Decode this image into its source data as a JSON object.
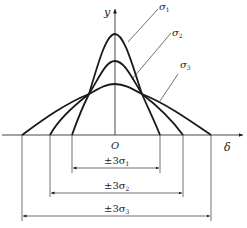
{
  "diagram": {
    "title": "",
    "axes": {
      "y_label": "y",
      "x_label": "δ",
      "origin_label": "O"
    },
    "curves": [
      {
        "name": "σ1",
        "label": "σ",
        "sub": "1",
        "peak_y": 34,
        "base_left": 72,
        "base_right": 160
      },
      {
        "name": "σ2",
        "label": "σ",
        "sub": "2",
        "peak_y": 61,
        "base_left": 50,
        "base_right": 183
      },
      {
        "name": "σ3",
        "label": "σ",
        "sub": "3",
        "peak_y": 84,
        "base_left": 22,
        "base_right": 211
      }
    ],
    "dimensions": [
      {
        "prefix": "±3σ",
        "sub": "1"
      },
      {
        "prefix": "±3σ",
        "sub": "2"
      },
      {
        "prefix": "±3σ",
        "sub": "3"
      }
    ],
    "colors": {
      "stroke": "#1a1a1a",
      "thin": "#333333"
    }
  }
}
